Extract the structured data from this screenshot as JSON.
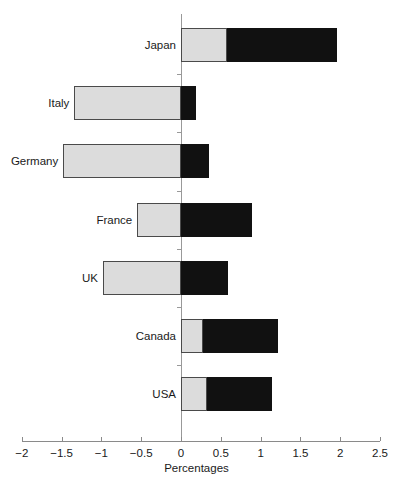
{
  "chart_data": {
    "type": "bar",
    "orientation": "horizontal",
    "stacked": true,
    "title": "",
    "xlabel": "Percentages",
    "ylabel": "",
    "xlim": [
      -2,
      2.5
    ],
    "xticks": [
      -2,
      -1.5,
      -1,
      -0.5,
      0,
      0.5,
      1,
      1.5,
      2,
      2.5
    ],
    "xtick_labels": [
      "−2",
      "−1.5",
      "−1",
      "−0.5",
      "0",
      "0.5",
      "1",
      "1.5",
      "2",
      "2.5"
    ],
    "grid": false,
    "legend": "none",
    "categories": [
      "Japan",
      "Italy",
      "Germany",
      "France",
      "UK",
      "Canada",
      "USA"
    ],
    "series": [
      {
        "name": "light-segment",
        "color": "#dcdcdc",
        "start": [
          0.0,
          -1.34,
          -1.48,
          -0.55,
          -0.98,
          0.0,
          0.0
        ],
        "end": [
          0.58,
          0.0,
          0.0,
          0.0,
          0.0,
          0.28,
          0.33
        ]
      },
      {
        "name": "dark-segment",
        "color": "#111111",
        "start": [
          0.58,
          0.0,
          0.0,
          0.0,
          0.0,
          0.28,
          0.33
        ],
        "end": [
          1.96,
          0.19,
          0.35,
          0.89,
          0.59,
          1.22,
          1.14
        ]
      }
    ]
  },
  "axis": {
    "x_title": "Percentages"
  }
}
